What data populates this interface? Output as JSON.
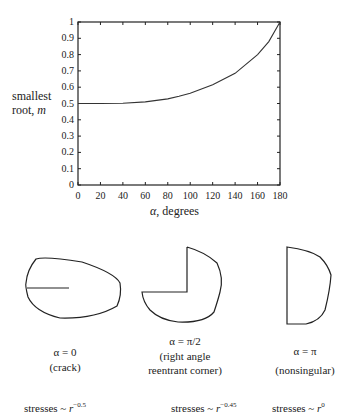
{
  "chart_data": {
    "type": "line",
    "title": "",
    "xlabel": "α, degrees",
    "ylabel": "smallest root, m",
    "xlim": [
      0,
      180
    ],
    "ylim": [
      0,
      1
    ],
    "grid": false,
    "x_ticks": [
      0,
      20,
      40,
      60,
      80,
      100,
      120,
      140,
      160,
      180
    ],
    "y_ticks": [
      0,
      0.1,
      0.2,
      0.3,
      0.4,
      0.5,
      0.6,
      0.7,
      0.8,
      0.9,
      1
    ],
    "x": [
      0,
      20,
      40,
      60,
      80,
      90,
      100,
      120,
      140,
      160,
      170,
      180
    ],
    "series": [
      {
        "name": "smallest root m",
        "values": [
          0.5,
          0.5,
          0.502,
          0.51,
          0.528,
          0.544,
          0.563,
          0.615,
          0.685,
          0.8,
          0.88,
          1.0
        ]
      }
    ]
  },
  "axes": {
    "ylabel_line1": "smallest",
    "ylabel_line2_text": "root, ",
    "ylabel_line2_var": "m",
    "xlabel_var": "α",
    "xlabel_text": ", degrees",
    "y_tick_labels": [
      "0",
      "0.1",
      "0.2",
      "0.3",
      "0.4",
      "0.5",
      "0.6",
      "0.7",
      "0.8",
      "0.9",
      "1"
    ],
    "x_tick_labels": [
      "0",
      "20",
      "40",
      "60",
      "80",
      "100",
      "120",
      "140",
      "160",
      "180"
    ]
  },
  "diagrams": [
    {
      "name": "crack",
      "angle_label": "α = 0",
      "desc_lines": [
        "(crack)"
      ],
      "stress_text": "stresses ~ ",
      "stress_var": "r",
      "stress_exp": "−0.5"
    },
    {
      "name": "right-angle",
      "angle_label": "α = π/2",
      "desc_lines": [
        "(right angle",
        "reentrant corner)"
      ],
      "stress_text": "stresses ~ ",
      "stress_var": "r",
      "stress_exp": "−0.45"
    },
    {
      "name": "nonsingular",
      "angle_label": "α = π",
      "desc_lines": [
        "(nonsingular)"
      ],
      "stress_text": "stresses ~ ",
      "stress_var": "r",
      "stress_exp": "0"
    }
  ]
}
